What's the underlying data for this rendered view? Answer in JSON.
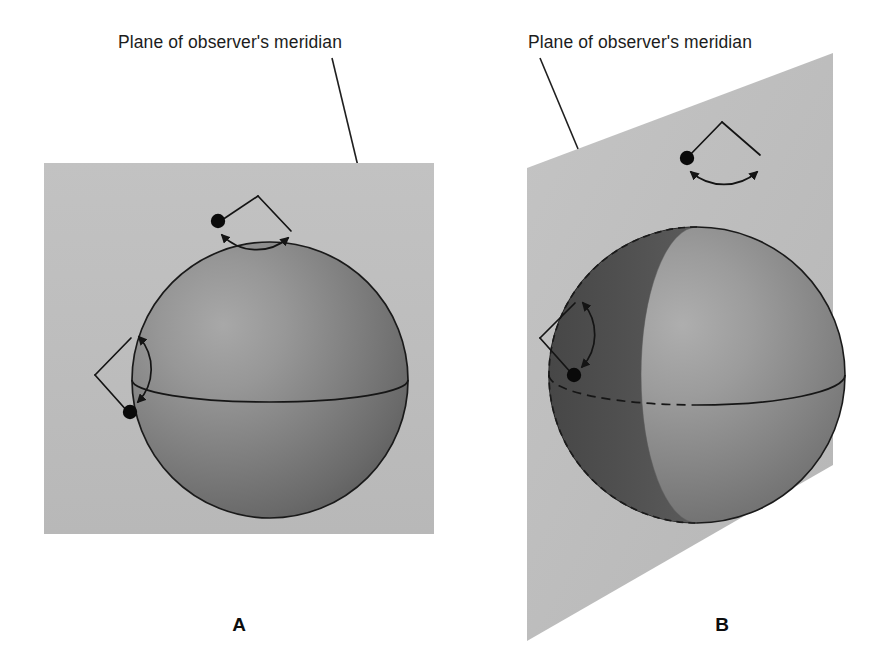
{
  "figure": {
    "background_color": "#ffffff"
  },
  "panels": [
    {
      "id": "A",
      "letter": "B-placeholder",
      "label": "A",
      "caption": "Plane of observer's meridian",
      "plane_shape": "rectangle",
      "plane_color": "#bdbdbd",
      "sphere": {
        "fill_light": "#9a9a9a",
        "fill_dark": "#5e5e5e",
        "outline_color": "#1a1a1a",
        "equator_style": "solid",
        "terminator_visible": false
      },
      "markers": [
        {
          "name": "top-rotation-fan",
          "position": "top",
          "dot_side": "left",
          "arrow_ends": "both"
        },
        {
          "name": "left-rotation-fan",
          "position": "left",
          "dot_side": "bottom",
          "arrow_ends": "both"
        }
      ]
    },
    {
      "id": "B",
      "letter": "B-placeholder",
      "label": "B",
      "caption": "Plane of observer's meridian",
      "plane_shape": "trapezoid-perspective",
      "plane_color": "#bdbdbd",
      "sphere": {
        "fill_light": "#9a9a9a",
        "fill_dark": "#4f4f4f",
        "outline_color": "#1a1a1a",
        "equator_style": "dashed-left-solid-right",
        "terminator_visible": true
      },
      "markers": [
        {
          "name": "top-rotation-fan",
          "position": "top",
          "dot_side": "left",
          "arrow_ends": "both"
        },
        {
          "name": "left-rotation-fan",
          "position": "left",
          "dot_side": "bottom",
          "arrow_ends": "both"
        }
      ]
    }
  ],
  "captions": {
    "panel_a_caption": "Plane of observer's meridian",
    "panel_b_caption": "Plane of observer's meridian",
    "panel_a_letter": "A",
    "panel_b_letter": "B"
  },
  "colors": {
    "plane_gray": "#bdbdbd",
    "sphere_light": "#9a9a9a",
    "sphere_dark": "#585858",
    "crescent_dark": "#4b4b4b",
    "ink": "#1a1a1a",
    "page": "#ffffff"
  }
}
